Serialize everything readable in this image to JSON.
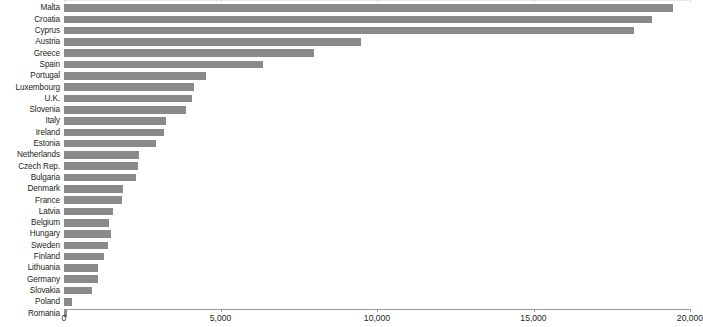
{
  "chart_data": {
    "type": "bar",
    "orientation": "horizontal",
    "title": "",
    "subtitle": "",
    "xlabel": "",
    "ylabel": "",
    "xlim": [
      0,
      20000
    ],
    "grid": false,
    "legend": null,
    "bar_color": "#8a8a8a",
    "axis_color": "#9b9b9b",
    "label_color": "#231f20",
    "xticks": [
      0,
      5000,
      10000,
      15000,
      20000
    ],
    "xtick_labels": [
      "0",
      "5,000",
      "10,000",
      "15,000",
      "20,000"
    ],
    "categories": [
      "Malta",
      "Croatia",
      "Cyprus",
      "Austria",
      "Greece",
      "Spain",
      "Portugal",
      "Luxembourg",
      "U.K.",
      "Slovenia",
      "Italy",
      "Ireland",
      "Estonia",
      "Netherlands",
      "Czech Rep.",
      "Bulgaria",
      "Denmark",
      "France",
      "Latvia",
      "Belgium",
      "Hungary",
      "Sweden",
      "Finland",
      "Lithuania",
      "Germany",
      "Slovakia",
      "Poland",
      "Romania"
    ],
    "values": [
      19450,
      18800,
      18200,
      9500,
      8000,
      6350,
      4550,
      4150,
      4100,
      3900,
      3250,
      3200,
      2950,
      2400,
      2350,
      2300,
      1900,
      1850,
      1550,
      1450,
      1500,
      1400,
      1280,
      1080,
      1080,
      900,
      260,
      80
    ]
  }
}
